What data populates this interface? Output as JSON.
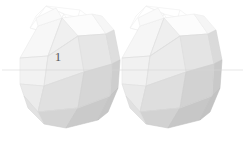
{
  "canvas": {
    "width": 245,
    "height": 141,
    "background": "#ffffff"
  },
  "scene": {
    "title": "two-polyhedra-render",
    "object_count": 2,
    "object_type": "icosahedron",
    "projection": "isometric"
  },
  "palette": {
    "face_lightest": "#fbfbfb",
    "face_light": "#f4f4f4",
    "face_mid_light": "#ededed",
    "face_mid": "#e4e4e4",
    "face_mid_dark": "#dcdcdc",
    "face_dark": "#d2d2d2",
    "face_darkest": "#c8c8c8",
    "edge": "#d8d8d8",
    "edge_soft": "#e6e6e6",
    "ghost_edge": "#f2f2f2",
    "guide_line": "#d0d0d0",
    "label_color": "#5a5a5a"
  },
  "labels": [
    {
      "id": "label-1",
      "text": "1",
      "x": 58,
      "y": 61,
      "size": 13,
      "color": "#5a5a5a"
    }
  ],
  "guides": [
    {
      "id": "horizontal-guide",
      "x1": 2,
      "y1": 70,
      "x2": 243,
      "y2": 70,
      "color": "#d8d8d8",
      "width": 0.6
    }
  ],
  "objects": [
    {
      "id": "polyhedron-left",
      "name": "icosahedron-left",
      "center_x": 72,
      "center_y": 73,
      "radius": 56,
      "label": "1"
    },
    {
      "id": "polyhedron-right",
      "name": "icosahedron-right",
      "center_x": 172,
      "center_y": 73,
      "radius": 56,
      "label": ""
    }
  ],
  "ghost_wireframes": [
    {
      "id": "ghost-left",
      "center_x": 72,
      "center_y": 30
    },
    {
      "id": "ghost-right",
      "center_x": 172,
      "center_y": 30
    }
  ]
}
